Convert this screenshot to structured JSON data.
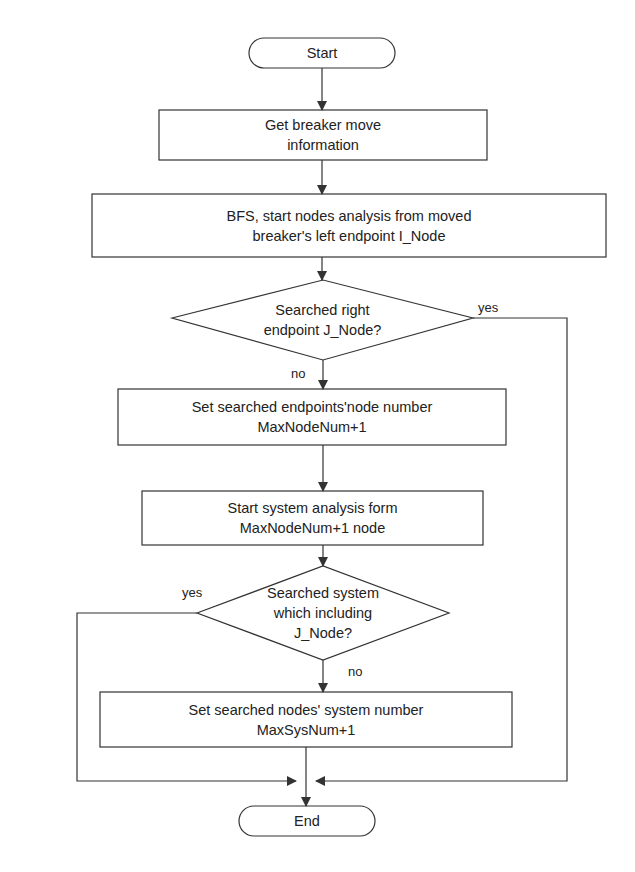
{
  "diagram": {
    "type": "flowchart",
    "colors": {
      "line": "#333333",
      "background": "#ffffff",
      "text": "#222222"
    },
    "nodes": [
      {
        "id": "start",
        "shape": "terminal",
        "lines": [
          "Start"
        ]
      },
      {
        "id": "get_info",
        "shape": "process",
        "lines": [
          "Get breaker move",
          "information"
        ]
      },
      {
        "id": "bfs",
        "shape": "process",
        "lines": [
          "BFS, start nodes analysis from moved",
          "breaker's left endpoint I_Node"
        ]
      },
      {
        "id": "decision1",
        "shape": "decision",
        "lines": [
          "Searched right",
          "endpoint J_Node?"
        ]
      },
      {
        "id": "set_node",
        "shape": "process",
        "lines": [
          "Set searched endpoints'node number",
          "MaxNodeNum+1"
        ]
      },
      {
        "id": "sys_analysis",
        "shape": "process",
        "lines": [
          "Start system analysis form",
          "MaxNodeNum+1 node"
        ]
      },
      {
        "id": "decision2",
        "shape": "decision",
        "lines": [
          "Searched system",
          "which including",
          "J_Node?"
        ]
      },
      {
        "id": "set_sys",
        "shape": "process",
        "lines": [
          "Set searched nodes' system number",
          "MaxSysNum+1"
        ]
      },
      {
        "id": "end",
        "shape": "terminal",
        "lines": [
          "End"
        ]
      }
    ],
    "edges": [
      {
        "from": "start",
        "to": "get_info",
        "label": ""
      },
      {
        "from": "get_info",
        "to": "bfs",
        "label": ""
      },
      {
        "from": "bfs",
        "to": "decision1",
        "label": ""
      },
      {
        "from": "decision1",
        "to": "set_node",
        "label": "no"
      },
      {
        "from": "decision1",
        "to": "end",
        "label": "yes"
      },
      {
        "from": "set_node",
        "to": "sys_analysis",
        "label": ""
      },
      {
        "from": "sys_analysis",
        "to": "decision2",
        "label": ""
      },
      {
        "from": "decision2",
        "to": "set_sys",
        "label": "no"
      },
      {
        "from": "decision2",
        "to": "end",
        "label": "yes"
      },
      {
        "from": "set_sys",
        "to": "end",
        "label": ""
      }
    ],
    "labels": {
      "d1_yes": "yes",
      "d1_no": "no",
      "d2_yes": "yes",
      "d2_no": "no"
    }
  },
  "text": {
    "start": "Start",
    "get_info_1": "Get breaker move",
    "get_info_2": "information",
    "bfs_1": "BFS, start nodes analysis from moved",
    "bfs_2": "breaker's left endpoint I_Node",
    "d1_1": "Searched right",
    "d1_2": "endpoint J_Node?",
    "set_node_1": "Set searched endpoints'node number",
    "set_node_2": "MaxNodeNum+1",
    "sys_1": "Start system analysis form",
    "sys_2": "MaxNodeNum+1 node",
    "d2_1": "Searched system",
    "d2_2": "which including",
    "d2_3": "J_Node?",
    "set_sys_1": "Set searched nodes' system number",
    "set_sys_2": "MaxSysNum+1",
    "end": "End"
  }
}
